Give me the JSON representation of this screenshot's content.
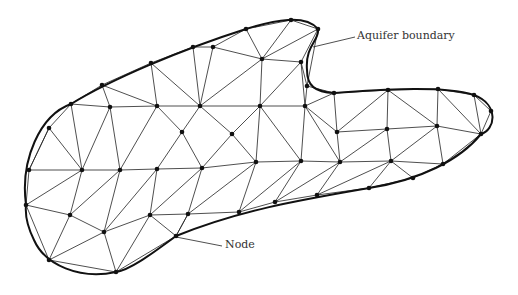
{
  "diagram": {
    "labels": {
      "boundary": "Aquifer boundary",
      "node": "Node"
    },
    "colors": {
      "line": "#222222",
      "boundary": "#111111",
      "node": "#111111",
      "label": "#333333"
    },
    "nodes": [
      [
        102,
        85
      ],
      [
        151,
        63
      ],
      [
        193,
        47
      ],
      [
        246,
        29
      ],
      [
        291,
        20
      ],
      [
        318,
        29
      ],
      [
        71,
        104
      ],
      [
        110,
        107
      ],
      [
        157,
        106
      ],
      [
        200,
        106
      ],
      [
        213,
        47
      ],
      [
        262,
        59
      ],
      [
        301,
        62
      ],
      [
        307,
        86
      ],
      [
        260,
        106
      ],
      [
        305,
        106
      ],
      [
        334,
        93
      ],
      [
        388,
        90
      ],
      [
        438,
        89
      ],
      [
        474,
        95
      ],
      [
        491,
        111
      ],
      [
        49,
        128
      ],
      [
        182,
        132
      ],
      [
        232,
        134
      ],
      [
        337,
        132
      ],
      [
        387,
        129
      ],
      [
        437,
        126
      ],
      [
        481,
        134
      ],
      [
        29,
        170
      ],
      [
        82,
        170
      ],
      [
        120,
        170
      ],
      [
        157,
        169
      ],
      [
        202,
        168
      ],
      [
        256,
        162
      ],
      [
        301,
        161
      ],
      [
        340,
        162
      ],
      [
        391,
        161
      ],
      [
        443,
        164
      ],
      [
        413,
        178
      ],
      [
        369,
        188
      ],
      [
        26,
        205
      ],
      [
        70,
        215
      ],
      [
        150,
        215
      ],
      [
        188,
        214
      ],
      [
        239,
        212
      ],
      [
        275,
        202
      ],
      [
        317,
        195
      ],
      [
        104,
        232
      ],
      [
        176,
        236
      ],
      [
        49,
        260
      ],
      [
        116,
        272
      ]
    ],
    "edges": [
      [
        0,
        1
      ],
      [
        1,
        2
      ],
      [
        2,
        10
      ],
      [
        10,
        3
      ],
      [
        3,
        4
      ],
      [
        4,
        5
      ],
      [
        5,
        13
      ],
      [
        13,
        16
      ],
      [
        16,
        17
      ],
      [
        17,
        18
      ],
      [
        18,
        19
      ],
      [
        19,
        20
      ],
      [
        6,
        0
      ],
      [
        6,
        7
      ],
      [
        0,
        7
      ],
      [
        7,
        8
      ],
      [
        0,
        8
      ],
      [
        1,
        8
      ],
      [
        8,
        9
      ],
      [
        1,
        9
      ],
      [
        9,
        2
      ],
      [
        9,
        10
      ],
      [
        9,
        11
      ],
      [
        10,
        11
      ],
      [
        3,
        11
      ],
      [
        4,
        11
      ],
      [
        5,
        11
      ],
      [
        11,
        12
      ],
      [
        5,
        12
      ],
      [
        12,
        13
      ],
      [
        11,
        14
      ],
      [
        12,
        14
      ],
      [
        12,
        15
      ],
      [
        13,
        15
      ],
      [
        14,
        15
      ],
      [
        15,
        16
      ],
      [
        9,
        14
      ],
      [
        6,
        21
      ],
      [
        21,
        28
      ],
      [
        6,
        29
      ],
      [
        7,
        29
      ],
      [
        7,
        30
      ],
      [
        8,
        22
      ],
      [
        9,
        22
      ],
      [
        22,
        31
      ],
      [
        22,
        32
      ],
      [
        9,
        23
      ],
      [
        14,
        23
      ],
      [
        23,
        32
      ],
      [
        23,
        33
      ],
      [
        14,
        33
      ],
      [
        14,
        34
      ],
      [
        15,
        34
      ],
      [
        15,
        35
      ],
      [
        16,
        24
      ],
      [
        15,
        24
      ],
      [
        24,
        35
      ],
      [
        24,
        17
      ],
      [
        24,
        25
      ],
      [
        17,
        25
      ],
      [
        25,
        35
      ],
      [
        25,
        36
      ],
      [
        17,
        26
      ],
      [
        18,
        26
      ],
      [
        25,
        26
      ],
      [
        26,
        36
      ],
      [
        26,
        37
      ],
      [
        18,
        27
      ],
      [
        19,
        27
      ],
      [
        20,
        27
      ],
      [
        26,
        27
      ],
      [
        27,
        37
      ],
      [
        37,
        38
      ],
      [
        36,
        38
      ],
      [
        36,
        37
      ],
      [
        21,
        29
      ],
      [
        28,
        29
      ],
      [
        29,
        30
      ],
      [
        30,
        31
      ],
      [
        8,
        30
      ],
      [
        31,
        32
      ],
      [
        32,
        33
      ],
      [
        33,
        34
      ],
      [
        34,
        35
      ],
      [
        35,
        36
      ],
      [
        21,
        28
      ],
      [
        28,
        40
      ],
      [
        29,
        40
      ],
      [
        29,
        41
      ],
      [
        30,
        41
      ],
      [
        30,
        47
      ],
      [
        31,
        47
      ],
      [
        31,
        42
      ],
      [
        32,
        42
      ],
      [
        32,
        43
      ],
      [
        33,
        43
      ],
      [
        33,
        44
      ],
      [
        34,
        44
      ],
      [
        34,
        45
      ],
      [
        35,
        45
      ],
      [
        35,
        46
      ],
      [
        36,
        46
      ],
      [
        36,
        39
      ],
      [
        38,
        39
      ],
      [
        46,
        39
      ],
      [
        44,
        45
      ],
      [
        45,
        46
      ],
      [
        40,
        41
      ],
      [
        41,
        47
      ],
      [
        47,
        42
      ],
      [
        42,
        43
      ],
      [
        43,
        44
      ],
      [
        42,
        48
      ],
      [
        43,
        48
      ],
      [
        40,
        49
      ],
      [
        41,
        49
      ],
      [
        47,
        49
      ],
      [
        47,
        50
      ],
      [
        49,
        50
      ],
      [
        48,
        50
      ],
      [
        42,
        50
      ],
      [
        43,
        48
      ]
    ],
    "boundary_path": "M 26 205 C 20 160, 40 115, 71 104 C 110 80, 180 50, 246 29 C 275 20, 305 14, 318 29 C 320 40, 305 45, 307 70 C 307 86, 315 92, 334 93 C 380 90, 440 85, 474 95 C 500 105, 495 130, 481 134 C 460 160, 420 180, 369 188 C 300 200, 240 210, 176 236 C 150 255, 130 270, 116 272 C 80 280, 45 265, 34 240 C 28 228, 25 215, 26 205 Z",
    "callouts": [
      {
        "name": "aquifer-boundary-callout",
        "x1": 313,
        "y1": 47,
        "x2": 355,
        "y2": 37
      },
      {
        "name": "node-callout",
        "x1": 176,
        "y1": 237,
        "x2": 222,
        "y2": 246
      }
    ]
  }
}
